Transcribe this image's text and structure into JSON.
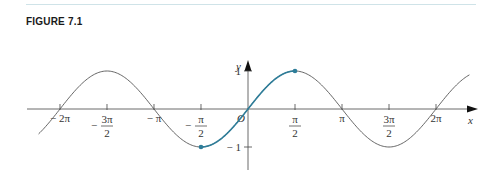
{
  "figure": {
    "title": "FIGURE 7.1"
  },
  "chart_data": {
    "type": "line",
    "title": "FIGURE 7.1",
    "function": "y = sin x",
    "xlabel": "x",
    "ylabel": "y",
    "origin_label": "O",
    "xlim": [
      -7.0,
      7.7
    ],
    "ylim": [
      -1.6,
      1.15
    ],
    "grid": false,
    "legend": null,
    "x_ticks": [
      {
        "value": -6.2832,
        "label": "− 2π"
      },
      {
        "value": -4.7124,
        "label_num": "3π",
        "label_den": "2",
        "sign": "−"
      },
      {
        "value": -3.1416,
        "label": "− π"
      },
      {
        "value": -1.5708,
        "label_num": "π",
        "label_den": "2",
        "sign": "−"
      },
      {
        "value": 1.5708,
        "label_num": "π",
        "label_den": "2"
      },
      {
        "value": 3.1416,
        "label": "π"
      },
      {
        "value": 4.7124,
        "label_num": "3π",
        "label_den": "2"
      },
      {
        "value": 6.2832,
        "label": "2π"
      }
    ],
    "y_ticks": [
      {
        "value": 1,
        "label": "1"
      },
      {
        "value": -1,
        "label": "− 1"
      }
    ],
    "series": [
      {
        "name": "sin x (full)",
        "color": "#555555",
        "x_range": [
          -7.0,
          7.4
        ]
      },
      {
        "name": "sin x restricted to [−π/2, π/2]",
        "color": "#2e7d99",
        "x_range": [
          -1.5708,
          1.5708
        ],
        "endpoints": [
          {
            "x": -1.5708,
            "y": -1
          },
          {
            "x": 1.5708,
            "y": 1
          }
        ]
      }
    ],
    "colors": {
      "curve": "#555555",
      "highlight": "#2e7d99",
      "axes": "#444444",
      "rule": "#cfe3e8"
    }
  }
}
